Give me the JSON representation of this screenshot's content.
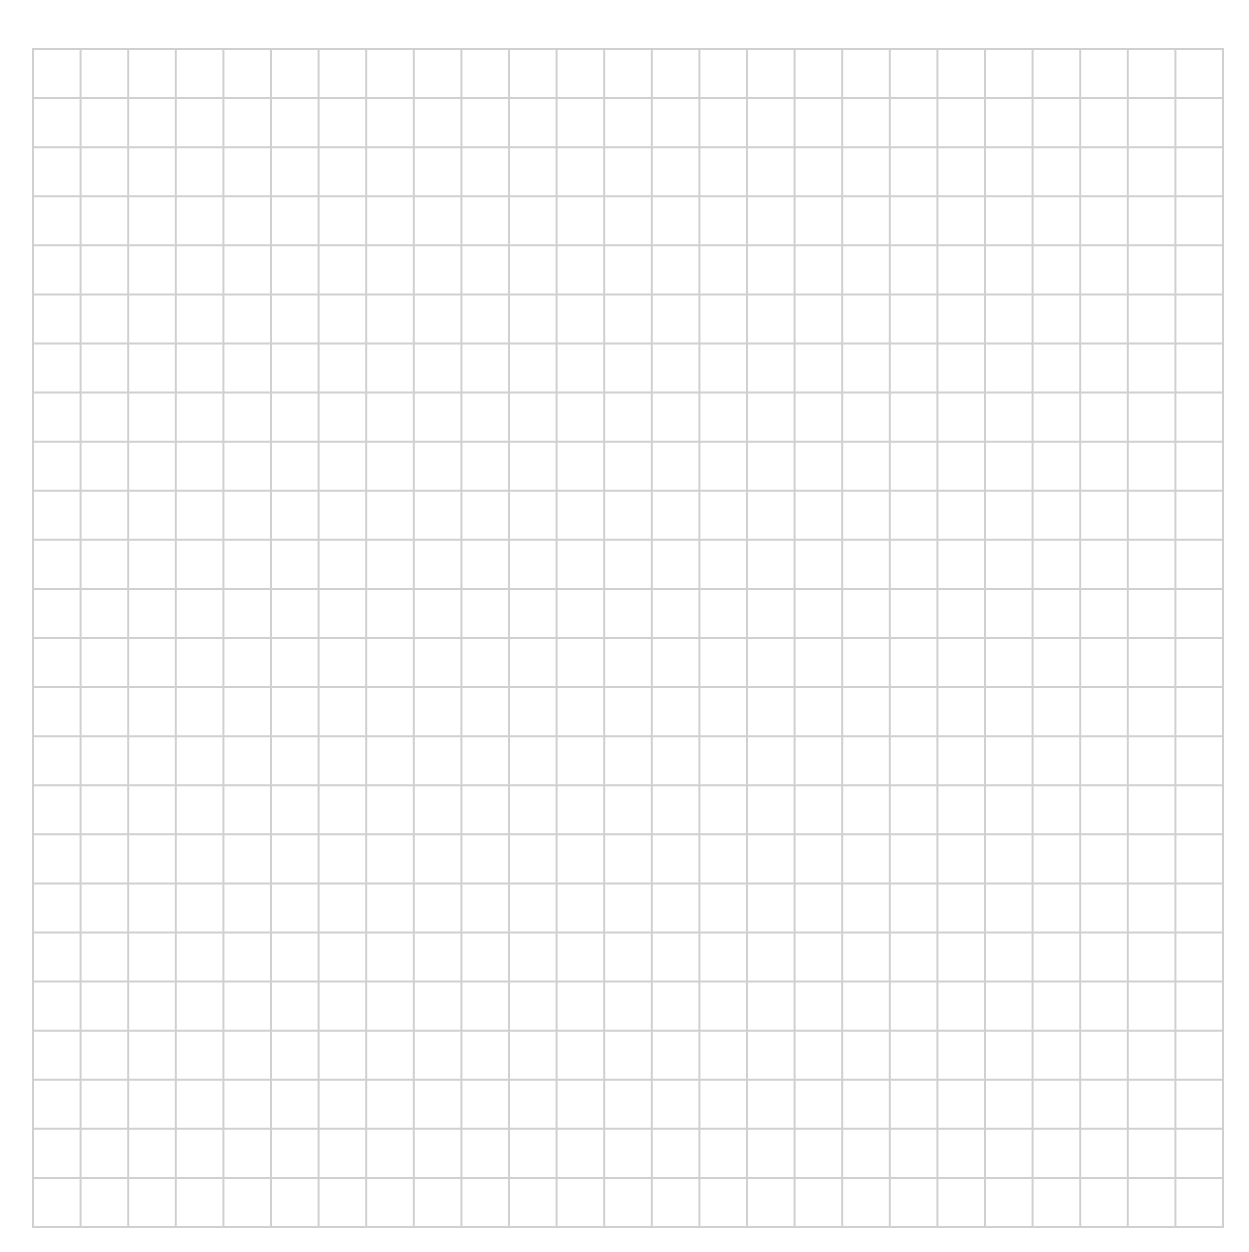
{
  "sheet": {
    "type": "graph-paper",
    "columns": 25,
    "rows": 24,
    "line_color": "#d0d0d0",
    "background_color": "#ffffff"
  }
}
